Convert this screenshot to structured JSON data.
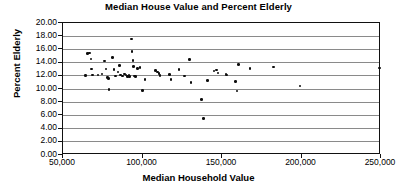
{
  "chart_data": {
    "type": "scatter",
    "title": "Median House Value and Percent Elderly",
    "xlabel": "Median Household Value",
    "ylabel": "Percent Elderly",
    "xlim": [
      50000,
      250000
    ],
    "ylim": [
      0.0,
      20.0
    ],
    "grid": true,
    "legend": null,
    "xticks": [
      50000,
      100000,
      150000,
      200000,
      250000
    ],
    "xtick_labels": [
      "50,000",
      "100,000",
      "150,000",
      "200,000",
      "250,000"
    ],
    "yticks": [
      0.0,
      2.0,
      4.0,
      6.0,
      8.0,
      10.0,
      12.0,
      14.0,
      16.0,
      18.0,
      20.0
    ],
    "ytick_labels": [
      "0.00",
      "2.00",
      "4.00",
      "6.00",
      "8.00",
      "10.00",
      "12.00",
      "14.00",
      "16.00",
      "18.00",
      "20.00"
    ],
    "marker": "filled-circle",
    "marker_color": "#0d0d0d",
    "points": [
      {
        "x": 64000,
        "y": 12.05
      },
      {
        "x": 65500,
        "y": 15.35
      },
      {
        "x": 66500,
        "y": 15.45
      },
      {
        "x": 67500,
        "y": 14.55
      },
      {
        "x": 68000,
        "y": 13.0
      },
      {
        "x": 68500,
        "y": 12.1
      },
      {
        "x": 72000,
        "y": 12.15
      },
      {
        "x": 74500,
        "y": 12.25
      },
      {
        "x": 76000,
        "y": 14.25
      },
      {
        "x": 77000,
        "y": 13.0
      },
      {
        "x": 78000,
        "y": 11.7
      },
      {
        "x": 78500,
        "y": 11.6
      },
      {
        "x": 79000,
        "y": 9.9
      },
      {
        "x": 81000,
        "y": 14.8
      },
      {
        "x": 82000,
        "y": 12.95
      },
      {
        "x": 83000,
        "y": 12.0
      },
      {
        "x": 84500,
        "y": 12.55
      },
      {
        "x": 85500,
        "y": 13.55
      },
      {
        "x": 86000,
        "y": 12.1
      },
      {
        "x": 87500,
        "y": 11.95
      },
      {
        "x": 88500,
        "y": 12.25
      },
      {
        "x": 89500,
        "y": 12.1
      },
      {
        "x": 90500,
        "y": 11.9
      },
      {
        "x": 91500,
        "y": 12.15
      },
      {
        "x": 92000,
        "y": 11.85
      },
      {
        "x": 93000,
        "y": 17.55
      },
      {
        "x": 93500,
        "y": 15.7
      },
      {
        "x": 94000,
        "y": 14.3
      },
      {
        "x": 94500,
        "y": 13.4
      },
      {
        "x": 95000,
        "y": 12.0
      },
      {
        "x": 95500,
        "y": 11.9
      },
      {
        "x": 97000,
        "y": 13.15
      },
      {
        "x": 98500,
        "y": 13.25
      },
      {
        "x": 100000,
        "y": 9.8
      },
      {
        "x": 101500,
        "y": 11.4
      },
      {
        "x": 108000,
        "y": 12.8
      },
      {
        "x": 109500,
        "y": 12.55
      },
      {
        "x": 110500,
        "y": 12.35
      },
      {
        "x": 111000,
        "y": 12.05
      },
      {
        "x": 117000,
        "y": 12.2
      },
      {
        "x": 118000,
        "y": 11.45
      },
      {
        "x": 123000,
        "y": 12.95
      },
      {
        "x": 126500,
        "y": 11.95
      },
      {
        "x": 129500,
        "y": 14.45
      },
      {
        "x": 130500,
        "y": 11.0
      },
      {
        "x": 137000,
        "y": 8.4
      },
      {
        "x": 138500,
        "y": 5.5
      },
      {
        "x": 141000,
        "y": 11.3
      },
      {
        "x": 145000,
        "y": 12.75
      },
      {
        "x": 146500,
        "y": 12.85
      },
      {
        "x": 147500,
        "y": 12.45
      },
      {
        "x": 152500,
        "y": 12.3
      },
      {
        "x": 153000,
        "y": 12.15
      },
      {
        "x": 158500,
        "y": 11.15
      },
      {
        "x": 159500,
        "y": 9.7
      },
      {
        "x": 160500,
        "y": 13.7
      },
      {
        "x": 167500,
        "y": 13.1
      },
      {
        "x": 182500,
        "y": 13.35
      },
      {
        "x": 199000,
        "y": 10.45
      },
      {
        "x": 249000,
        "y": 13.2
      }
    ]
  }
}
